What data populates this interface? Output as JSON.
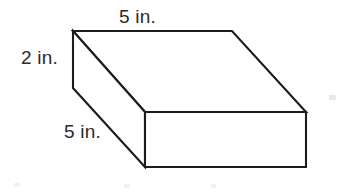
{
  "figure": {
    "name": "rectangular-prism",
    "shape_type": "rectangular prism",
    "background_color": "#ffffff",
    "stroke_color": "#1c1c1c",
    "fill_color": "#ffffff",
    "unit": "in.",
    "labels": {
      "top_edge": "5 in.",
      "left_vertical_edge": "2 in.",
      "bottom_left_depth_edge": "5 in."
    },
    "dimensions": {
      "length": "5 in.",
      "width": "5 in.",
      "height": "2 in."
    },
    "geometry": {
      "top_face": "73,31 232,31 306,112 145,112",
      "front_face": "145,112 306,112 306,167 145,167",
      "left_face": "73,31 145,112 145,167 73,88",
      "vertices": {
        "top_back_left": "73,31",
        "top_back_right": "232,31",
        "top_front_right": "306,112",
        "top_front_left": "145,112",
        "bottom_front_left": "145,167",
        "bottom_front_right": "306,167",
        "bottom_back_left": "73,88"
      }
    }
  }
}
